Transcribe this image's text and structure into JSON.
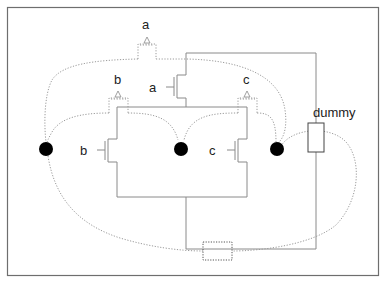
{
  "diagram": {
    "type": "transistor-network",
    "width": 384,
    "height": 283,
    "colors": {
      "wire": "#8a8a8a",
      "border": "#6e6e6e",
      "dotted": "#9a9a9a",
      "node": "#000000"
    },
    "transistors": [
      {
        "id": "a",
        "label": "a",
        "gate_label": "a"
      },
      {
        "id": "b",
        "label": "b",
        "gate_label": "b"
      },
      {
        "id": "c",
        "label": "c",
        "gate_label": "c"
      }
    ],
    "pins": [
      {
        "id": "pin-a",
        "label": "a"
      },
      {
        "id": "pin-b",
        "label": "b"
      },
      {
        "id": "pin-c",
        "label": "c"
      }
    ],
    "nodes": [
      {
        "id": "node-left"
      },
      {
        "id": "node-middle"
      },
      {
        "id": "node-right"
      }
    ],
    "dummy": {
      "label": "dummy"
    },
    "dashed_box": {
      "label": ""
    }
  }
}
